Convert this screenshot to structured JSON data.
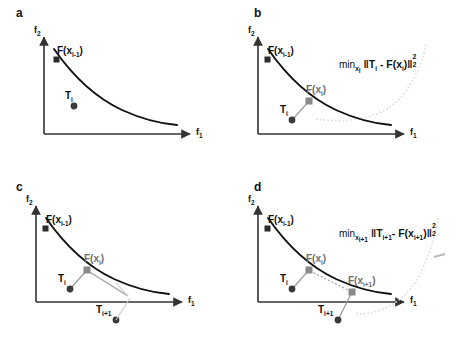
{
  "figure": {
    "width": 475,
    "height": 347,
    "background": "#ffffff",
    "colors": {
      "curve": "#111111",
      "axis": "#333333",
      "target_marker": "#3a3a3a",
      "mapped_marker": "#8a8a8a",
      "connector": "#9b9b9b",
      "guide_curve": "#d9d9d9",
      "text": "#111111",
      "gray_text": "#6d6d6d"
    }
  },
  "axes": {
    "x_label": "f",
    "x_label_sub": "1",
    "y_label": "f",
    "y_label_sub": "2"
  },
  "panels": [
    {
      "id": "a",
      "letter": "a",
      "has_formula": false,
      "formula": null,
      "labels": {
        "f_prev": {
          "base": "F(x",
          "sub": "i-1",
          "close": ")"
        },
        "t_i": {
          "base": "T",
          "sub": "i"
        }
      },
      "markers": [
        {
          "name": "F(x_i-1)",
          "type": "square",
          "color": "dark"
        },
        {
          "name": "T_i",
          "type": "circle",
          "color": "dark"
        }
      ]
    },
    {
      "id": "b",
      "letter": "b",
      "has_formula": true,
      "formula": {
        "min": "min",
        "min_sub": "x",
        "min_sub_sub": "i",
        "norm_open": "‖",
        "term1": "T",
        "term1_sub": "i",
        "minus": "-",
        "term2": "F(x",
        "term2_sub": "i",
        "term2_close": ")",
        "norm_close": "‖",
        "sup": "2",
        "sub": "2"
      },
      "labels": {
        "f_prev": {
          "base": "F(x",
          "sub": "i-1",
          "close": ")"
        },
        "f_i": {
          "base": "F(x",
          "sub": "i",
          "close": ")"
        },
        "t_i": {
          "base": "T",
          "sub": "i"
        }
      },
      "markers": [
        {
          "name": "F(x_i-1)",
          "type": "square",
          "color": "dark"
        },
        {
          "name": "F(x_i)",
          "type": "square",
          "color": "gray"
        },
        {
          "name": "T_i",
          "type": "circle",
          "color": "dark"
        }
      ]
    },
    {
      "id": "c",
      "letter": "c",
      "has_formula": false,
      "formula": null,
      "labels": {
        "f_prev": {
          "base": "F(x",
          "sub": "i-1",
          "close": ")"
        },
        "f_i": {
          "base": "F(x",
          "sub": "i",
          "close": ")"
        },
        "t_i": {
          "base": "T",
          "sub": "i"
        },
        "t_next": {
          "base": "T",
          "sub": "i+1"
        }
      },
      "markers": [
        {
          "name": "F(x_i-1)",
          "type": "square",
          "color": "dark"
        },
        {
          "name": "F(x_i)",
          "type": "square",
          "color": "gray"
        },
        {
          "name": "T_i",
          "type": "circle",
          "color": "dark"
        },
        {
          "name": "T_i+1",
          "type": "circle",
          "color": "dark"
        }
      ]
    },
    {
      "id": "d",
      "letter": "d",
      "has_formula": true,
      "formula": {
        "min": "min",
        "min_sub": "x",
        "min_sub_sub": "i+1",
        "norm_open": "‖",
        "term1": "T",
        "term1_sub": "i+1",
        "minus": "-",
        "term2": "F(x",
        "term2_sub": "i+1",
        "term2_close": ")",
        "norm_close": "‖",
        "sup": "2",
        "sub": "2"
      },
      "labels": {
        "f_prev": {
          "base": "F(x",
          "sub": "i-1",
          "close": ")"
        },
        "f_i": {
          "base": "F(x",
          "sub": "i",
          "close": ")"
        },
        "f_next": {
          "base": "F(x",
          "sub": "i+1",
          "close": ")"
        },
        "t_i": {
          "base": "T",
          "sub": "i"
        },
        "t_next": {
          "base": "T",
          "sub": "i+1"
        }
      },
      "markers": [
        {
          "name": "F(x_i-1)",
          "type": "square",
          "color": "dark"
        },
        {
          "name": "F(x_i)",
          "type": "square",
          "color": "gray"
        },
        {
          "name": "F(x_i+1)",
          "type": "square",
          "color": "gray"
        },
        {
          "name": "T_i",
          "type": "circle",
          "color": "dark"
        },
        {
          "name": "T_i+1",
          "type": "circle",
          "color": "dark"
        }
      ]
    }
  ]
}
